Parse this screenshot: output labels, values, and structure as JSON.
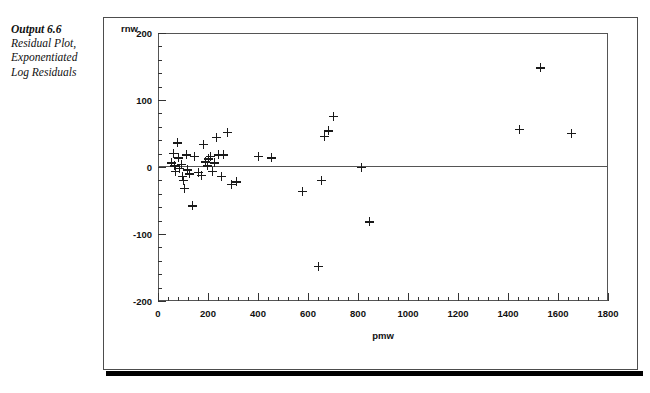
{
  "caption": {
    "title": "Output 6.6",
    "lines": [
      "Residual Plot,",
      "Exponentiated",
      "Log Residuals"
    ]
  },
  "chart_data": {
    "type": "scatter",
    "title": "",
    "xlabel": "pmw",
    "ylabel": "rnw",
    "xlim": [
      0,
      1800
    ],
    "ylim": [
      -200,
      200
    ],
    "xticks": [
      0,
      200,
      400,
      600,
      800,
      1000,
      1200,
      1400,
      1600,
      1800
    ],
    "yticks": [
      -200,
      -100,
      0,
      100,
      200
    ],
    "xtick_labels": [
      "0",
      "200",
      "400",
      "600",
      "800",
      "1000",
      "1200",
      "1400",
      "1600",
      "1800"
    ],
    "ytick_labels": [
      "-200",
      "-100",
      "0",
      "100",
      "200"
    ],
    "x_minor_step": 40,
    "y_minor_step": 20,
    "grid": false,
    "legend": null,
    "marker": "plus",
    "marker_color": "#1a1a1a",
    "reference_line_y": 0,
    "points": [
      {
        "x": 54,
        "y": 6
      },
      {
        "x": 60,
        "y": 20
      },
      {
        "x": 66,
        "y": 2
      },
      {
        "x": 70,
        "y": -6
      },
      {
        "x": 76,
        "y": 36
      },
      {
        "x": 82,
        "y": 14
      },
      {
        "x": 86,
        "y": -2
      },
      {
        "x": 92,
        "y": 4
      },
      {
        "x": 96,
        "y": -14
      },
      {
        "x": 100,
        "y": -20
      },
      {
        "x": 106,
        "y": -32
      },
      {
        "x": 112,
        "y": 18
      },
      {
        "x": 118,
        "y": -4
      },
      {
        "x": 126,
        "y": -10
      },
      {
        "x": 136,
        "y": -58
      },
      {
        "x": 146,
        "y": 16
      },
      {
        "x": 160,
        "y": -8
      },
      {
        "x": 172,
        "y": -12
      },
      {
        "x": 182,
        "y": 34
      },
      {
        "x": 190,
        "y": 8
      },
      {
        "x": 196,
        "y": 2
      },
      {
        "x": 202,
        "y": 12
      },
      {
        "x": 210,
        "y": 16
      },
      {
        "x": 216,
        "y": -6
      },
      {
        "x": 224,
        "y": 6
      },
      {
        "x": 232,
        "y": 44
      },
      {
        "x": 240,
        "y": 18
      },
      {
        "x": 252,
        "y": -14
      },
      {
        "x": 262,
        "y": 18
      },
      {
        "x": 276,
        "y": 52
      },
      {
        "x": 292,
        "y": -26
      },
      {
        "x": 312,
        "y": -22
      },
      {
        "x": 400,
        "y": 16
      },
      {
        "x": 452,
        "y": 14
      },
      {
        "x": 576,
        "y": -36
      },
      {
        "x": 640,
        "y": -148
      },
      {
        "x": 652,
        "y": -20
      },
      {
        "x": 664,
        "y": 46
      },
      {
        "x": 680,
        "y": 54
      },
      {
        "x": 700,
        "y": 76
      },
      {
        "x": 812,
        "y": 0
      },
      {
        "x": 846,
        "y": -82
      },
      {
        "x": 1444,
        "y": 56
      },
      {
        "x": 1528,
        "y": 148
      },
      {
        "x": 1652,
        "y": 50
      }
    ]
  }
}
